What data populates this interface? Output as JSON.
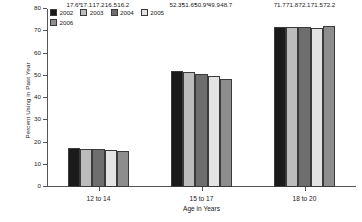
{
  "chart_data": {
    "type": "bar",
    "title": "",
    "xlabel": "Age in Years",
    "ylabel": "Percent Using in Past Year",
    "categories": [
      "12 to 14",
      "15 to 17",
      "18 to 20"
    ],
    "ylim": [
      0,
      80
    ],
    "ytick_labels": [
      "80",
      "70",
      "60",
      "50",
      "40",
      "30",
      "20",
      "10",
      "0"
    ],
    "ytick_values": [
      80,
      70,
      60,
      50,
      40,
      30,
      20,
      10,
      0
    ],
    "grid": false,
    "legend_position": "top-left",
    "series": [
      {
        "name": "2002",
        "color": "#1a1a1a",
        "values": [
          17.6,
          52.3,
          71.7
        ],
        "labels": [
          "17.6*",
          "52.3*",
          "71.7"
        ]
      },
      {
        "name": "2003",
        "color": "#bcbcbc",
        "values": [
          17.1,
          51.6,
          71.8
        ],
        "labels": [
          "17.1",
          "51.6*",
          "71.8"
        ]
      },
      {
        "name": "2004",
        "color": "#6e6e6e",
        "values": [
          17.2,
          50.9,
          72.1
        ],
        "labels": [
          "17.2",
          "50.9*",
          "72.1"
        ]
      },
      {
        "name": "2005",
        "color": "#e3e3e3",
        "values": [
          16.5,
          49.9,
          71.5
        ],
        "labels": [
          "16.5",
          "49.9",
          "71.5"
        ]
      },
      {
        "name": "2006",
        "color": "#8d8d8d",
        "values": [
          16.2,
          48.7,
          72.2
        ],
        "labels": [
          "16.2",
          "48.7",
          "72.2"
        ]
      }
    ]
  }
}
